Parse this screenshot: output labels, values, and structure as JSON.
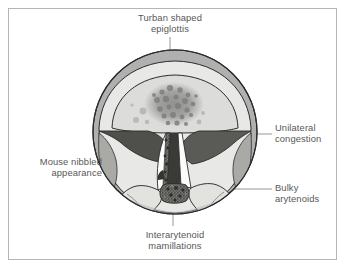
{
  "figure": {
    "type": "medical-illustration",
    "frame_color": "#b5b5b5",
    "background_color": "#ffffff"
  },
  "labels": {
    "epiglottis": {
      "text": "Turban shaped\nepiglottis",
      "name": "turban-shaped-epiglottis",
      "position": "top"
    },
    "unilateral_congestion": {
      "text": "Unilateral\ncongestion",
      "name": "unilateral-congestion",
      "position": "right-upper"
    },
    "bulky_arytenoids": {
      "text": "Bulky\narytenoids",
      "name": "bulky-arytenoids",
      "position": "right-lower"
    },
    "mouse_nibbled": {
      "text": "Mouse nibbled\nappearance",
      "name": "mouse-nibbled-appearance",
      "position": "left"
    },
    "interarytenoid_mamillations": {
      "text": "Interarytenoid\nmamillations",
      "name": "interarytenoid-mamillations",
      "position": "bottom"
    }
  },
  "colors": {
    "text": "#585858",
    "leader_line": "#8a8a8a",
    "outline": "#2b2b2b",
    "outer_ring": "#b0b0b0",
    "pharynx_field": "#e8e8e6",
    "epiglottis_body": "#dcdcda",
    "epiglottis_mottle": "#8e8e8c",
    "false_cord_congested": "#5a5a5a",
    "vocal_cord": "#fcfcfc",
    "arytenoid_bulky": "#e2e2df",
    "arytenoid_shadow": "#c2c2bf",
    "interarytenoid_nodular": "#6a6a66",
    "nibbled_edge": "#4a4a46"
  },
  "anatomy": [
    {
      "name": "outer-ring",
      "label": "laryngeal inlet rim"
    },
    {
      "name": "epiglottis",
      "label": "turban shaped epiglottis"
    },
    {
      "name": "left-false-cord",
      "label": "left false cord"
    },
    {
      "name": "right-false-cord",
      "label": "congested right false cord"
    },
    {
      "name": "left-vocal-cord",
      "label": "left vocal cord with nibbled margin"
    },
    {
      "name": "right-vocal-cord",
      "label": "right vocal cord"
    },
    {
      "name": "left-arytenoid",
      "label": "left bulky arytenoid"
    },
    {
      "name": "right-arytenoid",
      "label": "right bulky arytenoid"
    },
    {
      "name": "interarytenoid-region",
      "label": "interarytenoid mamillations"
    },
    {
      "name": "glottic-opening",
      "label": "glottic airway"
    }
  ]
}
